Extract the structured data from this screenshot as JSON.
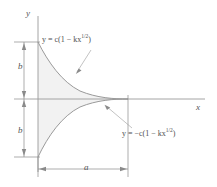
{
  "figure": {
    "type": "math-curve-diagram",
    "background_color": "#ffffff",
    "curve_color": "#8a8a8a",
    "axis_color": "#9a9a9a",
    "fill_color": "#f2f2f2",
    "dimension_color": "#8a8a8a",
    "text_color": "#4f4f4f",
    "axes": {
      "y_label": "y",
      "x_label": "x"
    },
    "labels": {
      "upper_curve_equation": "y = c(1 − kx",
      "upper_curve_exponent": "1/2",
      "upper_curve_equation_close": ")",
      "lower_curve_equation": "y = −c(1 − kx",
      "lower_curve_exponent": "1/2",
      "lower_curve_equation_close": ")",
      "upper_curve_equation_full": "y = c(1 − kx^(1/2))",
      "lower_curve_equation_full": "y = −c(1 − kx^(1/2))"
    },
    "dimensions": {
      "height_upper": "b",
      "height_lower": "b",
      "width": "a"
    },
    "geometry": {
      "origin_x": 38,
      "origin_y": 99,
      "curve_end_x": 128,
      "curve_top_y": 42,
      "curve_bottom_y": 157,
      "x_axis_right": 205,
      "y_axis_top": 16
    }
  }
}
